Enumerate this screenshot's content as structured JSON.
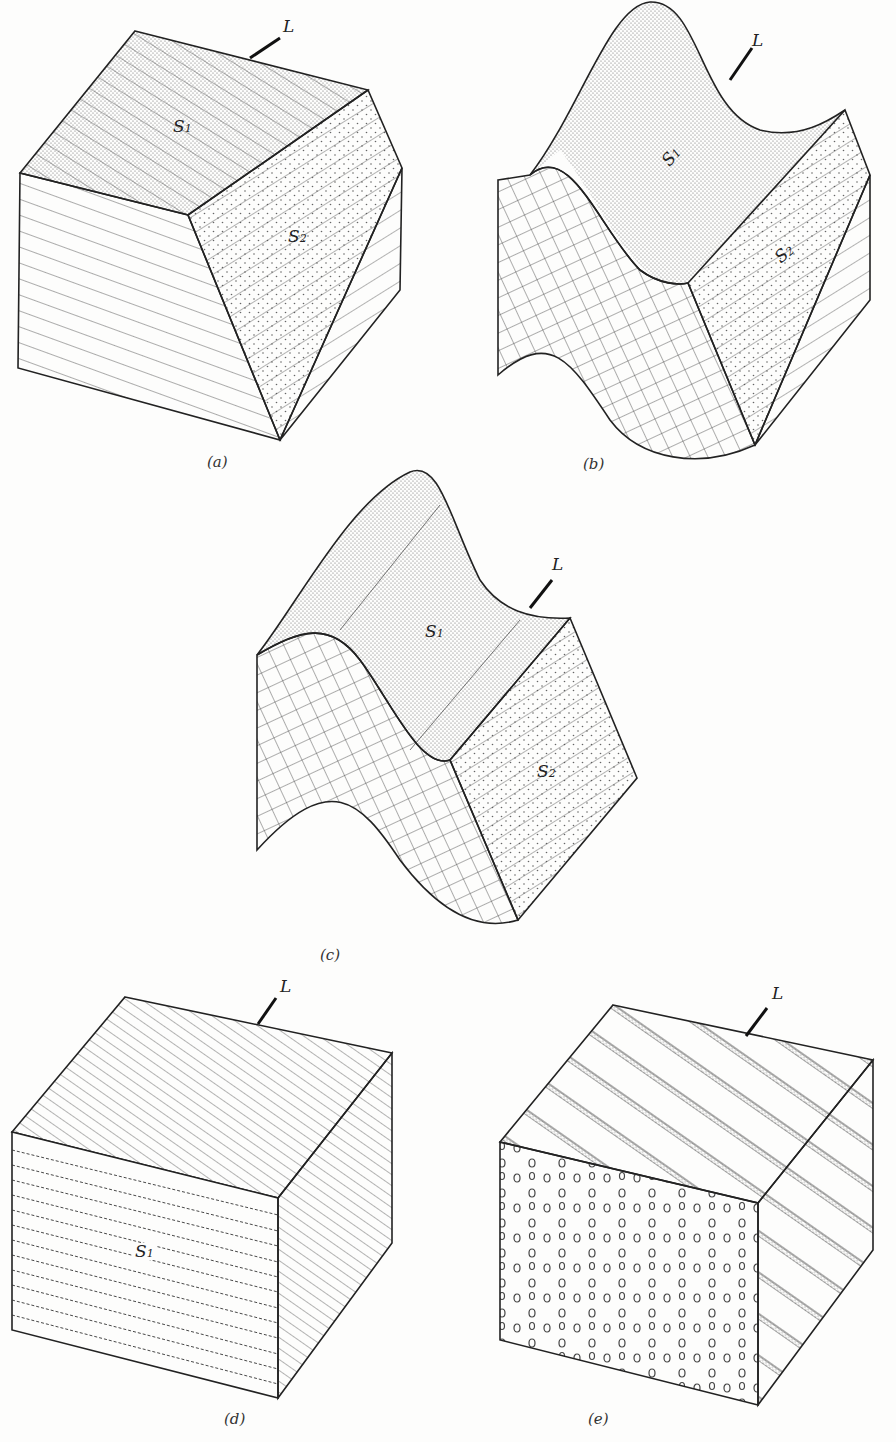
{
  "figure": {
    "type": "geologic block diagrams of lineation",
    "panels": [
      {
        "id": "a",
        "caption": "(a)",
        "labels": {
          "lineation": "L",
          "surface1": "S",
          "surface1_sub": "1",
          "surface2": "S",
          "surface2_sub": "2"
        },
        "description": "Intersection lineation of two planar surfaces"
      },
      {
        "id": "b",
        "caption": "(b)",
        "labels": {
          "lineation": "L",
          "surface1": "S",
          "surface1_sub": "1",
          "surface2": "S",
          "surface2_sub": "2"
        },
        "description": "Folded surface S1 with S2 intersection"
      },
      {
        "id": "c",
        "caption": "(c)",
        "labels": {
          "lineation": "L",
          "surface1": "S",
          "surface1_sub": "1",
          "surface2": "S",
          "surface2_sub": "2"
        },
        "description": "Fold axis parallel lineation"
      },
      {
        "id": "d",
        "caption": "(d)",
        "labels": {
          "lineation": "L",
          "surface1": "S",
          "surface1_sub": "1"
        },
        "description": "Crenulation lineation on S1"
      },
      {
        "id": "e",
        "caption": "(e)",
        "labels": {
          "lineation": "L"
        },
        "description": "Rod / mineral lineation"
      }
    ],
    "colors": {
      "ink": "#222222",
      "paper": "#fdfdfc",
      "stipple": "#555555"
    }
  }
}
